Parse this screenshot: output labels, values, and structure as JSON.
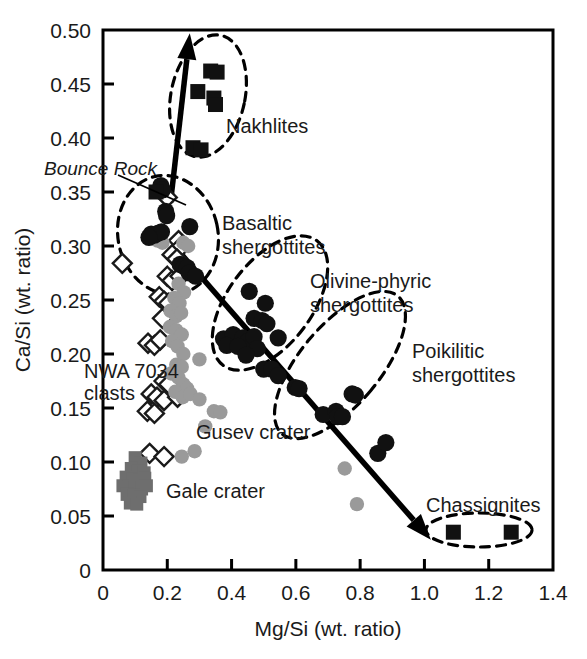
{
  "chart_data": {
    "type": "scatter",
    "title": "",
    "xlabel": "Mg/Si (wt. ratio)",
    "ylabel": "Ca/Si (wt. ratio)",
    "xlim": [
      0,
      1.4
    ],
    "ylim": [
      0,
      0.5
    ],
    "xticks": [
      "0",
      "0.2",
      "0.4",
      "0.6",
      "0.8",
      "1.0",
      "1.2",
      "1.4"
    ],
    "xtick_values": [
      0,
      0.2,
      0.4,
      0.6,
      0.8,
      1.0,
      1.2,
      1.4
    ],
    "yticks": [
      "0",
      "0.05",
      "0.10",
      "0.15",
      "0.20",
      "0.25",
      "0.30",
      "0.35",
      "0.40",
      "0.45",
      "0.50"
    ],
    "ytick_values": [
      0,
      0.05,
      0.1,
      0.15,
      0.2,
      0.25,
      0.3,
      0.35,
      0.4,
      0.45,
      0.5
    ],
    "grid": false,
    "legend_position": "none",
    "colors": {
      "black_marker": "#111111",
      "gray_marker": "#9a9a9a",
      "gale_gray": "#6e6e6e",
      "open_marker_stroke": "#1a1a1a",
      "axis": "#000000"
    },
    "series": [
      {
        "name": "Nakhlites",
        "marker": "filled-square",
        "color": "#111111",
        "points": [
          [
            0.335,
            0.462
          ],
          [
            0.355,
            0.461
          ],
          [
            0.295,
            0.443
          ],
          [
            0.345,
            0.437
          ],
          [
            0.35,
            0.431
          ],
          [
            0.28,
            0.391
          ],
          [
            0.305,
            0.389
          ]
        ]
      },
      {
        "name": "Bounce Rock",
        "marker": "filled-square",
        "color": "#111111",
        "points": [
          [
            0.165,
            0.35
          ]
        ]
      },
      {
        "name": "Basaltic shergottites",
        "marker": "filled-circle",
        "color": "#111111",
        "points": [
          [
            0.18,
            0.356
          ],
          [
            0.185,
            0.352
          ],
          [
            0.195,
            0.332
          ],
          [
            0.198,
            0.328
          ],
          [
            0.15,
            0.311
          ],
          [
            0.16,
            0.31
          ],
          [
            0.172,
            0.312
          ],
          [
            0.182,
            0.313
          ],
          [
            0.143,
            0.308
          ],
          [
            0.27,
            0.318
          ],
          [
            0.24,
            0.283
          ],
          [
            0.252,
            0.281
          ],
          [
            0.262,
            0.28
          ],
          [
            0.268,
            0.275
          ],
          [
            0.288,
            0.272
          ]
        ]
      },
      {
        "name": "Olivine-phyric shergottites",
        "marker": "filled-circle",
        "color": "#111111",
        "points": [
          [
            0.455,
            0.258
          ],
          [
            0.505,
            0.247
          ],
          [
            0.47,
            0.233
          ],
          [
            0.495,
            0.231
          ],
          [
            0.51,
            0.228
          ],
          [
            0.375,
            0.214
          ],
          [
            0.405,
            0.218
          ],
          [
            0.435,
            0.215
          ],
          [
            0.452,
            0.212
          ],
          [
            0.47,
            0.216
          ],
          [
            0.385,
            0.208
          ],
          [
            0.42,
            0.207
          ],
          [
            0.48,
            0.205
          ],
          [
            0.445,
            0.199
          ],
          [
            0.545,
            0.215
          ],
          [
            0.5,
            0.186
          ],
          [
            0.525,
            0.186
          ],
          [
            0.545,
            0.18
          ],
          [
            0.598,
            0.169
          ],
          [
            0.61,
            0.168
          ]
        ]
      },
      {
        "name": "Poikilitic shergottites",
        "marker": "filled-circle",
        "color": "#111111",
        "points": [
          [
            0.685,
            0.144
          ],
          [
            0.725,
            0.147
          ],
          [
            0.73,
            0.142
          ],
          [
            0.745,
            0.142
          ],
          [
            0.775,
            0.163
          ],
          [
            0.785,
            0.162
          ],
          [
            0.855,
            0.108
          ],
          [
            0.88,
            0.118
          ]
        ]
      },
      {
        "name": "Chassignites",
        "marker": "filled-square",
        "color": "#111111",
        "points": [
          [
            1.09,
            0.035
          ],
          [
            1.27,
            0.035
          ]
        ]
      },
      {
        "name": "NWA 7034 clasts",
        "marker": "open-diamond",
        "color": "#ffffff",
        "points": [
          [
            0.2,
            0.345
          ],
          [
            0.235,
            0.305
          ],
          [
            0.245,
            0.3
          ],
          [
            0.215,
            0.292
          ],
          [
            0.23,
            0.288
          ],
          [
            0.06,
            0.284
          ],
          [
            0.2,
            0.272
          ],
          [
            0.215,
            0.268
          ],
          [
            0.24,
            0.272
          ],
          [
            0.175,
            0.253
          ],
          [
            0.19,
            0.249
          ],
          [
            0.205,
            0.247
          ],
          [
            0.185,
            0.233
          ],
          [
            0.14,
            0.21
          ],
          [
            0.16,
            0.208
          ],
          [
            0.178,
            0.213
          ],
          [
            0.19,
            0.175
          ],
          [
            0.205,
            0.172
          ],
          [
            0.15,
            0.163
          ],
          [
            0.168,
            0.16
          ],
          [
            0.19,
            0.157
          ],
          [
            0.232,
            0.16
          ],
          [
            0.138,
            0.147
          ],
          [
            0.16,
            0.145
          ],
          [
            0.145,
            0.108
          ],
          [
            0.19,
            0.105
          ]
        ]
      },
      {
        "name": "Gusev crater",
        "marker": "filled-circle",
        "color": "#9a9a9a",
        "points": [
          [
            0.17,
            0.305
          ],
          [
            0.185,
            0.303
          ],
          [
            0.25,
            0.303
          ],
          [
            0.265,
            0.3
          ],
          [
            0.235,
            0.265
          ],
          [
            0.252,
            0.257
          ],
          [
            0.222,
            0.252
          ],
          [
            0.238,
            0.247
          ],
          [
            0.21,
            0.24
          ],
          [
            0.228,
            0.235
          ],
          [
            0.243,
            0.238
          ],
          [
            0.208,
            0.225
          ],
          [
            0.228,
            0.222
          ],
          [
            0.245,
            0.218
          ],
          [
            0.215,
            0.212
          ],
          [
            0.232,
            0.207
          ],
          [
            0.25,
            0.2
          ],
          [
            0.3,
            0.195
          ],
          [
            0.228,
            0.19
          ],
          [
            0.245,
            0.188
          ],
          [
            0.212,
            0.182
          ],
          [
            0.235,
            0.178
          ],
          [
            0.25,
            0.172
          ],
          [
            0.262,
            0.168
          ],
          [
            0.225,
            0.165
          ],
          [
            0.248,
            0.16
          ],
          [
            0.272,
            0.163
          ],
          [
            0.3,
            0.158
          ],
          [
            0.345,
            0.147
          ],
          [
            0.365,
            0.146
          ],
          [
            0.318,
            0.133
          ],
          [
            0.285,
            0.11
          ],
          [
            0.245,
            0.105
          ],
          [
            0.752,
            0.094
          ],
          [
            0.79,
            0.061
          ]
        ]
      },
      {
        "name": "Gale crater",
        "marker": "filled-square",
        "color": "#6e6e6e",
        "points": [
          [
            0.1,
            0.104
          ],
          [
            0.118,
            0.099
          ],
          [
            0.088,
            0.094
          ],
          [
            0.108,
            0.092
          ],
          [
            0.128,
            0.09
          ],
          [
            0.072,
            0.086
          ],
          [
            0.092,
            0.084
          ],
          [
            0.112,
            0.083
          ],
          [
            0.13,
            0.085
          ],
          [
            0.062,
            0.078
          ],
          [
            0.082,
            0.077
          ],
          [
            0.1,
            0.076
          ],
          [
            0.12,
            0.075
          ],
          [
            0.135,
            0.078
          ],
          [
            0.075,
            0.07
          ],
          [
            0.095,
            0.069
          ],
          [
            0.115,
            0.068
          ],
          [
            0.085,
            0.062
          ],
          [
            0.105,
            0.061
          ]
        ]
      }
    ],
    "annotations": [
      {
        "id": "nakhlites",
        "text": "Nakhlites",
        "lines": [
          "Nakhlites"
        ]
      },
      {
        "id": "bounce-rock",
        "text": "Bounce Rock",
        "lines": [
          "Bounce Rock"
        ],
        "italic": true
      },
      {
        "id": "basaltic",
        "text": "Basaltic shergottites",
        "lines": [
          "Basaltic",
          "shergottites"
        ]
      },
      {
        "id": "olivine-phyric",
        "text": "Olivine-phyric shergottites",
        "lines": [
          "Olivine-phyric",
          "shergottites"
        ]
      },
      {
        "id": "poikilitic",
        "text": "Poikilitic shergottites",
        "lines": [
          "Poikilitic",
          "shergottites"
        ]
      },
      {
        "id": "chassignites",
        "text": "Chassignites",
        "lines": [
          "Chassignites"
        ]
      },
      {
        "id": "nwa7034",
        "text": "NWA 7034 clasts",
        "lines": [
          "NWA 7034",
          "clasts"
        ]
      },
      {
        "id": "gusev",
        "text": "Gusev crater",
        "lines": [
          "Gusev crater"
        ]
      },
      {
        "id": "gale",
        "text": "Gale crater",
        "lines": [
          "Gale crater"
        ]
      }
    ],
    "trend_arrows": [
      {
        "id": "upward-trend-arrow",
        "from": [
          0.21,
          0.34
        ],
        "to": [
          0.27,
          0.497
        ]
      },
      {
        "id": "downward-trend-arrow",
        "from": [
          0.245,
          0.292
        ],
        "to": [
          1.02,
          0.028
        ]
      }
    ]
  },
  "axis": {
    "x_title": "Mg/Si (wt. ratio)",
    "y_title": "Ca/Si (wt. ratio)",
    "x_labels": [
      "0",
      "0.2",
      "0.4",
      "0.6",
      "0.8",
      "1.0",
      "1.2",
      "1.4"
    ],
    "y_labels": [
      "0",
      "0.05",
      "0.10",
      "0.15",
      "0.20",
      "0.25",
      "0.30",
      "0.35",
      "0.40",
      "0.45",
      "0.50"
    ]
  },
  "labels": {
    "nakhlites": "Nakhlites",
    "bounce_rock": "Bounce Rock",
    "basaltic_l1": "Basaltic",
    "basaltic_l2": "shergottites",
    "olivine_l1": "Olivine-phyric",
    "olivine_l2": "shergottites",
    "poikilitic_l1": "Poikilitic",
    "poikilitic_l2": "shergottites",
    "chassignites": "Chassignites",
    "nwa_l1": "NWA 7034",
    "nwa_l2": "clasts",
    "gusev": "Gusev crater",
    "gale": "Gale crater"
  }
}
